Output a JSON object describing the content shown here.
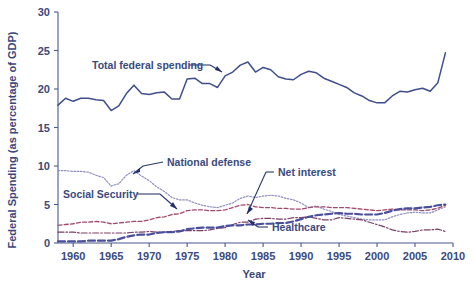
{
  "chart_data": {
    "type": "line",
    "title": "",
    "xlabel": "Year",
    "ylabel": "Federal Spending (as percentage of GDP)",
    "xlim": [
      1958,
      2010
    ],
    "ylim": [
      0,
      30
    ],
    "xticks": [
      1960,
      1965,
      1970,
      1975,
      1980,
      1985,
      1990,
      1995,
      2000,
      2005,
      2010
    ],
    "yticks": [
      0,
      5,
      10,
      15,
      20,
      25,
      30
    ],
    "grid": false,
    "legend_position": "inline-annotations",
    "x": [
      1958,
      1959,
      1960,
      1961,
      1962,
      1963,
      1964,
      1965,
      1966,
      1967,
      1968,
      1969,
      1970,
      1971,
      1972,
      1973,
      1974,
      1975,
      1976,
      1977,
      1978,
      1979,
      1980,
      1981,
      1982,
      1983,
      1984,
      1985,
      1986,
      1987,
      1988,
      1989,
      1990,
      1991,
      1992,
      1993,
      1994,
      1995,
      1996,
      1997,
      1998,
      1999,
      2000,
      2001,
      2002,
      2003,
      2004,
      2005,
      2006,
      2007,
      2008,
      2009
    ],
    "series": [
      {
        "name": "Total federal spending",
        "color": "#3f4e8c",
        "style": "solid",
        "values": [
          17.9,
          18.8,
          18.4,
          18.8,
          18.8,
          18.6,
          18.5,
          17.2,
          17.8,
          19.4,
          20.5,
          19.4,
          19.3,
          19.5,
          19.6,
          18.7,
          18.7,
          21.3,
          21.4,
          20.7,
          20.7,
          20.2,
          21.7,
          22.2,
          23.1,
          23.5,
          22.2,
          22.8,
          22.5,
          21.6,
          21.3,
          21.2,
          21.9,
          22.3,
          22.1,
          21.4,
          21.0,
          20.6,
          20.2,
          19.5,
          19.1,
          18.5,
          18.2,
          18.2,
          19.1,
          19.7,
          19.6,
          19.9,
          20.1,
          19.7,
          20.8,
          24.7
        ]
      },
      {
        "name": "National defense",
        "color": "#8e8fc0",
        "style": "dotted",
        "values": [
          9.4,
          9.4,
          9.3,
          9.3,
          9.2,
          8.8,
          8.5,
          7.4,
          7.7,
          8.8,
          9.4,
          8.7,
          8.1,
          7.3,
          6.7,
          5.9,
          5.6,
          5.6,
          5.2,
          4.9,
          4.7,
          4.6,
          4.9,
          5.2,
          5.8,
          6.1,
          5.9,
          6.1,
          6.2,
          6.1,
          5.8,
          5.6,
          5.2,
          4.6,
          4.8,
          4.4,
          4.1,
          3.7,
          3.5,
          3.3,
          3.1,
          3.0,
          3.0,
          3.0,
          3.4,
          3.7,
          3.9,
          4.0,
          3.9,
          3.9,
          4.3,
          4.7
        ]
      },
      {
        "name": "Social Security",
        "color": "#9e4a6e",
        "style": "dashed-fine",
        "values": [
          2.3,
          2.4,
          2.5,
          2.7,
          2.7,
          2.8,
          2.7,
          2.5,
          2.6,
          2.7,
          2.8,
          2.8,
          3.0,
          3.3,
          3.4,
          3.7,
          3.8,
          4.2,
          4.3,
          4.3,
          4.2,
          4.2,
          4.3,
          4.6,
          4.9,
          5.0,
          4.7,
          4.6,
          4.6,
          4.5,
          4.5,
          4.4,
          4.4,
          4.6,
          4.7,
          4.7,
          4.6,
          4.6,
          4.6,
          4.5,
          4.4,
          4.3,
          4.2,
          4.3,
          4.4,
          4.3,
          4.3,
          4.3,
          4.2,
          4.3,
          4.5,
          4.9
        ]
      },
      {
        "name": "Net interest",
        "color": "#7b3f66",
        "style": "dashdot",
        "values": [
          1.4,
          1.4,
          1.4,
          1.3,
          1.3,
          1.3,
          1.3,
          1.3,
          1.3,
          1.3,
          1.4,
          1.4,
          1.5,
          1.4,
          1.4,
          1.5,
          1.6,
          1.6,
          1.6,
          1.6,
          1.7,
          1.9,
          2.0,
          2.4,
          2.7,
          2.7,
          3.1,
          3.2,
          3.2,
          3.1,
          3.1,
          3.3,
          3.3,
          3.4,
          3.2,
          3.0,
          3.0,
          3.3,
          3.2,
          3.1,
          3.0,
          2.7,
          2.4,
          2.1,
          1.7,
          1.5,
          1.4,
          1.5,
          1.7,
          1.7,
          1.8,
          1.5
        ]
      },
      {
        "name": "Healthcare",
        "color": "#4a4f9c",
        "style": "dashed-bold",
        "values": [
          0.2,
          0.2,
          0.2,
          0.2,
          0.3,
          0.3,
          0.3,
          0.3,
          0.5,
          0.8,
          1.0,
          1.1,
          1.1,
          1.3,
          1.4,
          1.4,
          1.5,
          1.8,
          1.9,
          2.0,
          2.0,
          2.0,
          2.2,
          2.3,
          2.3,
          2.4,
          2.4,
          2.5,
          2.5,
          2.6,
          2.6,
          2.8,
          3.1,
          3.4,
          3.6,
          3.7,
          3.8,
          3.9,
          3.8,
          3.8,
          3.7,
          3.7,
          3.7,
          3.9,
          4.2,
          4.4,
          4.5,
          4.5,
          4.6,
          4.7,
          4.9,
          5.0
        ]
      }
    ]
  },
  "annotations": [
    {
      "name": "total-federal-spending",
      "label": "Total federal spending"
    },
    {
      "name": "national-defense",
      "label": "National defense"
    },
    {
      "name": "social-security",
      "label": "Social Security"
    },
    {
      "name": "net-interest",
      "label": "Net interest"
    },
    {
      "name": "healthcare",
      "label": "Healthcare"
    }
  ],
  "axes": {
    "x_title": "Year",
    "y_title": "Federal Spending (as percentage of GDP)",
    "x_tick_labels": [
      "1960",
      "1965",
      "1970",
      "1975",
      "1980",
      "1985",
      "1990",
      "1995",
      "2000",
      "2005",
      "2010"
    ],
    "y_tick_labels": [
      "0",
      "5",
      "10",
      "15",
      "20",
      "25",
      "30"
    ]
  },
  "colors": {
    "text": "#3a4a7d",
    "axis": "#4a5a8c",
    "total": "#3f4e8c",
    "defense": "#8e8fc0",
    "social_security": "#9e4a6e",
    "net_interest": "#7b3f66",
    "healthcare": "#4a4f9c",
    "background": "#ffffff"
  }
}
